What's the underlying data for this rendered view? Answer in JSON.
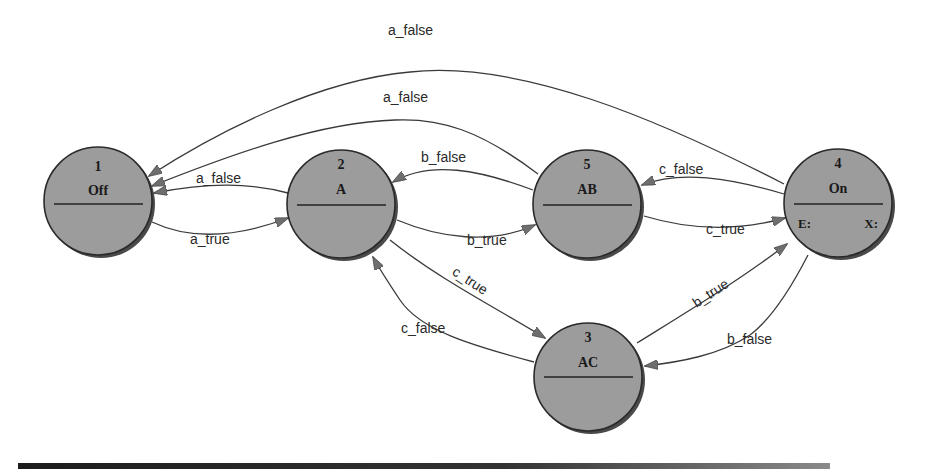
{
  "diagram": {
    "type": "state-machine",
    "colors": {
      "node_fill": "#9c9c9c",
      "node_stroke": "#2a2a2a",
      "edge": "#3a3a3a",
      "arrowhead": "#6e6e6e"
    },
    "nodes": [
      {
        "id": "1",
        "name": "Off",
        "entry": "",
        "exit": ""
      },
      {
        "id": "2",
        "name": "A",
        "entry": "",
        "exit": ""
      },
      {
        "id": "5",
        "name": "AB",
        "entry": "",
        "exit": ""
      },
      {
        "id": "4",
        "name": "On",
        "entry": "E:",
        "exit": "X:"
      },
      {
        "id": "3",
        "name": "AC",
        "entry": "",
        "exit": ""
      }
    ],
    "edges": [
      {
        "from": "4",
        "to": "1",
        "label": "a_false"
      },
      {
        "from": "5",
        "to": "1",
        "label": "a_false"
      },
      {
        "from": "2",
        "to": "1",
        "label": "a_false"
      },
      {
        "from": "1",
        "to": "2",
        "label": "a_true"
      },
      {
        "from": "5",
        "to": "2",
        "label": "b_false"
      },
      {
        "from": "2",
        "to": "5",
        "label": "b_true"
      },
      {
        "from": "4",
        "to": "5",
        "label": "c_false"
      },
      {
        "from": "5",
        "to": "4",
        "label": "c_true"
      },
      {
        "from": "2",
        "to": "3",
        "label": "c_true"
      },
      {
        "from": "3",
        "to": "2",
        "label": "c_false"
      },
      {
        "from": "3",
        "to": "4",
        "label": "b_true"
      },
      {
        "from": "4",
        "to": "3",
        "label": "b_false"
      }
    ]
  }
}
